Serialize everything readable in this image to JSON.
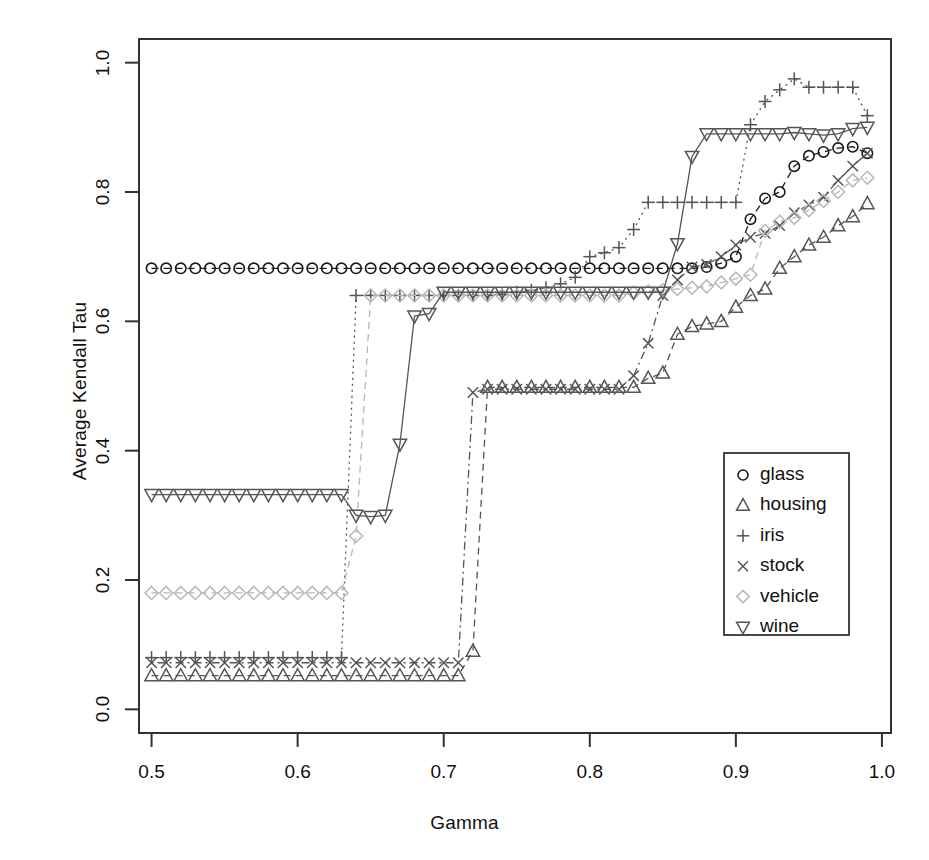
{
  "chart_data": {
    "type": "scatter",
    "title": "",
    "xlabel": "Gamma",
    "ylabel": "Average Kendall Tau",
    "xlim": [
      0.4914,
      1.0062
    ],
    "ylim": [
      -0.0366,
      1.0366
    ],
    "xticks": [
      0.5,
      0.6,
      0.7,
      0.8,
      0.9,
      1.0
    ],
    "xtick_labels": [
      "0.5",
      "0.6",
      "0.7",
      "0.8",
      "0.9",
      "1.0"
    ],
    "yticks": [
      0.0,
      0.2,
      0.4,
      0.6,
      0.8,
      1.0
    ],
    "ytick_labels": [
      "0.0",
      "0.2",
      "0.4",
      "0.6",
      "0.8",
      "1.0"
    ],
    "grid": false,
    "legend_position": "center-right",
    "legend_entries": [
      "glass",
      "housing",
      "iris",
      "stock",
      "vehicle",
      "wine"
    ],
    "x": [
      0.5,
      0.51,
      0.52,
      0.53,
      0.54,
      0.55,
      0.56,
      0.57,
      0.58,
      0.59,
      0.6,
      0.61,
      0.62,
      0.63,
      0.64,
      0.65,
      0.66,
      0.67,
      0.68,
      0.69,
      0.7,
      0.71,
      0.72,
      0.73,
      0.74,
      0.75,
      0.76,
      0.77,
      0.78,
      0.79,
      0.8,
      0.81,
      0.82,
      0.83,
      0.84,
      0.85,
      0.86,
      0.87,
      0.88,
      0.89,
      0.9,
      0.91,
      0.92,
      0.93,
      0.94,
      0.95,
      0.96,
      0.97,
      0.98,
      0.99
    ],
    "series": [
      {
        "name": "glass",
        "marker": "circle",
        "color": "#1a1a1a",
        "linetype": "dashed",
        "values": [
          0.682,
          0.682,
          0.682,
          0.682,
          0.682,
          0.682,
          0.682,
          0.682,
          0.682,
          0.682,
          0.682,
          0.682,
          0.682,
          0.682,
          0.682,
          0.682,
          0.682,
          0.682,
          0.682,
          0.682,
          0.682,
          0.682,
          0.682,
          0.682,
          0.682,
          0.682,
          0.682,
          0.682,
          0.682,
          0.682,
          0.682,
          0.682,
          0.682,
          0.682,
          0.682,
          0.682,
          0.682,
          0.682,
          0.684,
          0.69,
          0.7,
          0.758,
          0.79,
          0.8,
          0.84,
          0.856,
          0.862,
          0.868,
          0.87,
          0.86
        ]
      },
      {
        "name": "housing",
        "marker": "triangle-up",
        "color": "#555555",
        "linetype": "dashed",
        "values": [
          0.052,
          0.052,
          0.052,
          0.052,
          0.052,
          0.052,
          0.052,
          0.052,
          0.052,
          0.052,
          0.052,
          0.052,
          0.052,
          0.052,
          0.052,
          0.052,
          0.052,
          0.052,
          0.052,
          0.052,
          0.052,
          0.052,
          0.09,
          0.498,
          0.498,
          0.498,
          0.498,
          0.498,
          0.498,
          0.498,
          0.498,
          0.498,
          0.498,
          0.498,
          0.512,
          0.52,
          0.58,
          0.592,
          0.596,
          0.6,
          0.622,
          0.64,
          0.65,
          0.682,
          0.7,
          0.718,
          0.73,
          0.748,
          0.762,
          0.782
        ]
      },
      {
        "name": "iris",
        "marker": "plus",
        "color": "#555555",
        "linetype": "dotted",
        "values": [
          0.08,
          0.08,
          0.08,
          0.08,
          0.08,
          0.08,
          0.08,
          0.08,
          0.08,
          0.08,
          0.08,
          0.08,
          0.08,
          0.08,
          0.64,
          0.64,
          0.64,
          0.64,
          0.64,
          0.64,
          0.64,
          0.64,
          0.64,
          0.64,
          0.642,
          0.645,
          0.648,
          0.652,
          0.658,
          0.668,
          0.7,
          0.706,
          0.714,
          0.742,
          0.784,
          0.784,
          0.784,
          0.784,
          0.784,
          0.784,
          0.784,
          0.904,
          0.94,
          0.958,
          0.975,
          0.962,
          0.962,
          0.962,
          0.962,
          0.918
        ]
      },
      {
        "name": "stock",
        "marker": "cross",
        "color": "#555555",
        "linetype": "dotdash",
        "values": [
          0.072,
          0.072,
          0.072,
          0.072,
          0.072,
          0.072,
          0.072,
          0.072,
          0.072,
          0.072,
          0.072,
          0.072,
          0.072,
          0.072,
          0.072,
          0.072,
          0.072,
          0.072,
          0.072,
          0.072,
          0.072,
          0.072,
          0.49,
          0.495,
          0.495,
          0.495,
          0.495,
          0.495,
          0.495,
          0.495,
          0.495,
          0.495,
          0.495,
          0.516,
          0.566,
          0.64,
          0.664,
          0.684,
          0.688,
          0.7,
          0.718,
          0.73,
          0.736,
          0.748,
          0.768,
          0.78,
          0.792,
          0.818,
          0.84,
          0.86
        ]
      },
      {
        "name": "vehicle",
        "marker": "diamond",
        "color": "#b7b7b7",
        "linetype": "dashed",
        "values": [
          0.18,
          0.18,
          0.18,
          0.18,
          0.18,
          0.18,
          0.18,
          0.18,
          0.18,
          0.18,
          0.18,
          0.18,
          0.18,
          0.18,
          0.268,
          0.64,
          0.64,
          0.64,
          0.64,
          0.64,
          0.64,
          0.64,
          0.64,
          0.64,
          0.64,
          0.64,
          0.64,
          0.64,
          0.64,
          0.64,
          0.64,
          0.64,
          0.64,
          0.644,
          0.646,
          0.648,
          0.65,
          0.652,
          0.654,
          0.66,
          0.666,
          0.672,
          0.74,
          0.754,
          0.76,
          0.772,
          0.786,
          0.8,
          0.818,
          0.822
        ]
      },
      {
        "name": "wine",
        "marker": "triangle-down",
        "color": "#555555",
        "linetype": "solid",
        "values": [
          0.332,
          0.332,
          0.332,
          0.332,
          0.332,
          0.332,
          0.332,
          0.332,
          0.332,
          0.332,
          0.332,
          0.332,
          0.332,
          0.332,
          0.3,
          0.298,
          0.3,
          0.41,
          0.608,
          0.612,
          0.645,
          0.645,
          0.645,
          0.645,
          0.645,
          0.645,
          0.645,
          0.645,
          0.645,
          0.645,
          0.645,
          0.645,
          0.645,
          0.645,
          0.645,
          0.645,
          0.72,
          0.855,
          0.89,
          0.89,
          0.89,
          0.89,
          0.89,
          0.89,
          0.892,
          0.89,
          0.888,
          0.89,
          0.898,
          0.9
        ]
      }
    ]
  },
  "legend": {
    "items": [
      {
        "label": "glass",
        "marker": "circle"
      },
      {
        "label": "housing",
        "marker": "triangle-up"
      },
      {
        "label": "iris",
        "marker": "plus"
      },
      {
        "label": "stock",
        "marker": "cross"
      },
      {
        "label": "vehicle",
        "marker": "diamond"
      },
      {
        "label": "wine",
        "marker": "triangle-down"
      }
    ]
  },
  "colors": {
    "frame": "#333333",
    "text": "#111111",
    "background": "#ffffff"
  }
}
